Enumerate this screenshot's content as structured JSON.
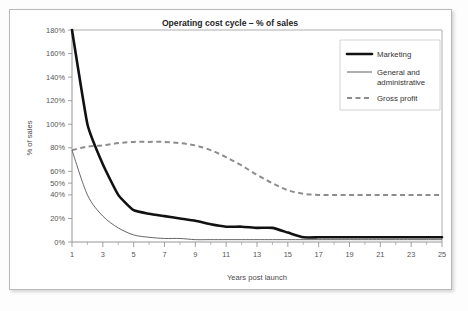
{
  "chart_data": {
    "type": "line",
    "title": "Operating cost cycle – % of sales",
    "xlabel": "Years post launch",
    "ylabel": "% of sales",
    "xlim": [
      1,
      25
    ],
    "ylim": [
      0,
      180
    ],
    "grid": false,
    "legend_position": "top-right",
    "y_tick_labels": [
      "180%",
      "160%",
      "140%",
      "120%",
      "100%",
      "80%",
      "60%",
      "50%",
      "40%",
      "20%",
      "0%"
    ],
    "y_tick_values": [
      180,
      160,
      140,
      120,
      100,
      80,
      60,
      50,
      40,
      20,
      0
    ],
    "x_tick_labels": [
      "1",
      "3",
      "5",
      "7",
      "9",
      "11",
      "13",
      "15",
      "17",
      "19",
      "21",
      "23",
      "25"
    ],
    "x_tick_values": [
      1,
      3,
      5,
      7,
      9,
      11,
      13,
      15,
      17,
      19,
      21,
      23,
      25
    ],
    "x_minor_ticks": [
      2,
      4,
      6,
      8,
      10,
      12,
      14,
      16,
      18,
      20,
      22,
      24
    ],
    "x": [
      1,
      2,
      3,
      4,
      5,
      6,
      7,
      8,
      9,
      10,
      11,
      12,
      13,
      14,
      15,
      16,
      17,
      18,
      19,
      20,
      21,
      22,
      23,
      24,
      25
    ],
    "series": [
      {
        "name": "Marketing",
        "style": "thick-solid",
        "color": "#111111",
        "values": [
          180,
          100,
          66,
          40,
          27,
          24,
          22,
          20,
          18,
          15,
          13,
          13,
          12,
          12,
          8,
          4,
          4,
          4,
          4,
          4,
          4,
          4,
          4,
          4,
          4
        ]
      },
      {
        "name": "General and administrative",
        "style": "thin-solid",
        "color": "#4a4a4a",
        "values": [
          78,
          40,
          22,
          12,
          6,
          4,
          3,
          3,
          2,
          2,
          2,
          2,
          2,
          2,
          2,
          2,
          2,
          2,
          2,
          2,
          2,
          2,
          2,
          2,
          2
        ]
      },
      {
        "name": "Gross profit",
        "style": "dashed",
        "color": "#8d8d8d",
        "values": [
          78,
          81,
          82,
          84,
          85,
          85,
          85,
          84,
          82,
          78,
          72,
          65,
          57,
          50,
          44,
          41,
          40,
          40,
          40,
          40,
          40,
          40,
          40,
          40,
          40
        ]
      }
    ]
  },
  "legend": {
    "entries": [
      {
        "label": "Marketing"
      },
      {
        "label": "General and",
        "label2": "administrative"
      },
      {
        "label": "Gross profit"
      }
    ]
  }
}
